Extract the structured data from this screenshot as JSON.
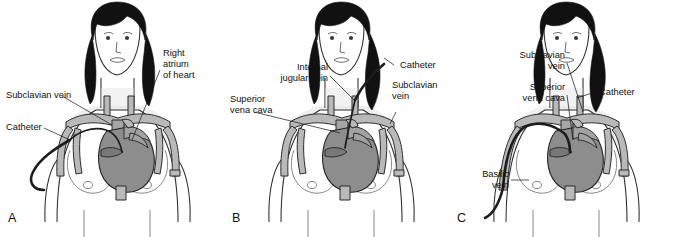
{
  "figure": {
    "type": "medical-illustration",
    "background_color": "#ffffff",
    "text_color": "#111111",
    "heart_color": "#8d8d8d",
    "vessel_color": "#b9b9b9",
    "hair_color": "#111111",
    "catheter_color": "#1c1c1c"
  },
  "panels": [
    {
      "letter": "A",
      "name": "subclavian-vein-insertion",
      "labels": [
        {
          "id": "subclavian-vein",
          "text": "Subclavian vein",
          "align": "start"
        },
        {
          "id": "catheter",
          "text": "Catheter",
          "align": "start"
        },
        {
          "id": "right-atrium-line1",
          "text": "Right",
          "align": "start"
        },
        {
          "id": "right-atrium-line2",
          "text": "atrium",
          "align": "start"
        },
        {
          "id": "right-atrium-line3",
          "text": "of heart",
          "align": "start"
        }
      ]
    },
    {
      "letter": "B",
      "name": "internal-jugular-vein-insertion",
      "labels": [
        {
          "id": "internal-jugular-line1",
          "text": "Internal",
          "align": "end"
        },
        {
          "id": "internal-jugular-line2",
          "text": "jugular vein",
          "align": "end"
        },
        {
          "id": "superior-vena-cava-line1",
          "text": "Superior",
          "align": "start"
        },
        {
          "id": "superior-vena-cava-line2",
          "text": "vena cava",
          "align": "start"
        },
        {
          "id": "catheter",
          "text": "Catheter",
          "align": "start"
        },
        {
          "id": "subclavian-line1",
          "text": "Subclavian",
          "align": "start"
        },
        {
          "id": "subclavian-line2",
          "text": "vein",
          "align": "start"
        }
      ]
    },
    {
      "letter": "C",
      "name": "basilic-vein-picc-insertion",
      "labels": [
        {
          "id": "subclavian-line1",
          "text": "Subclavian",
          "align": "end"
        },
        {
          "id": "subclavian-line2",
          "text": "vein",
          "align": "end"
        },
        {
          "id": "svc-line1",
          "text": "Superior",
          "align": "end"
        },
        {
          "id": "svc-line2",
          "text": "vena cava",
          "align": "end"
        },
        {
          "id": "basilic-line1",
          "text": "Basilic",
          "align": "end"
        },
        {
          "id": "basilic-line2",
          "text": "vein",
          "align": "end"
        },
        {
          "id": "catheter",
          "text": "Catheter",
          "align": "start"
        }
      ]
    }
  ]
}
